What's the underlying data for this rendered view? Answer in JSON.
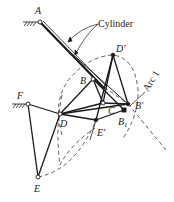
{
  "diagram": {
    "labels": {
      "A": "A",
      "cylinder": "Cylinder",
      "D_prime": "D'",
      "B": "B",
      "B_prime": "B'",
      "C": "C",
      "B1": "B",
      "B1_sub": "1",
      "F": "F",
      "D": "D",
      "E_prime": "E'",
      "E": "E",
      "arc1": "Arc 1"
    },
    "points": {
      "A": [
        40,
        22
      ],
      "D_prime": [
        113,
        55
      ],
      "B": [
        93,
        79
      ],
      "C": [
        103,
        103
      ],
      "B_prime": [
        128,
        104
      ],
      "B1": [
        124,
        110
      ],
      "F": [
        28,
        104
      ],
      "D": [
        60,
        114
      ],
      "E_prime": [
        96,
        120
      ],
      "E": [
        38,
        177
      ]
    },
    "colors": {
      "line": "#1a1a1a",
      "background": "#ffffff"
    }
  }
}
